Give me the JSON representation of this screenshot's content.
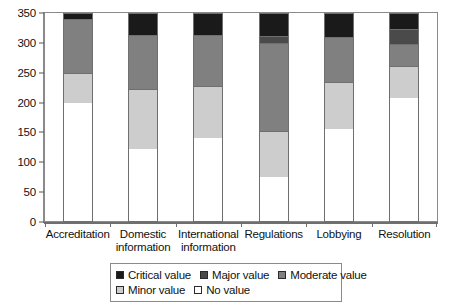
{
  "chart_data": {
    "type": "bar",
    "stacked": true,
    "title": "",
    "xlabel": "",
    "ylabel": "",
    "ylim": [
      0,
      350
    ],
    "ytick_step": 50,
    "yticks": [
      0,
      50,
      100,
      150,
      200,
      250,
      300,
      350
    ],
    "grid": false,
    "legend_position": "bottom",
    "categories": [
      "Accreditation",
      "Domestic information",
      "International information",
      "Regulations",
      "Lobbying",
      "Resolution"
    ],
    "series": [
      {
        "name": "No value",
        "color": "#ffffff",
        "values": [
          200,
          122,
          140,
          75,
          155,
          208
        ]
      },
      {
        "name": "Minor value",
        "color": "#cdcdcd",
        "values": [
          50,
          101,
          88,
          77,
          80,
          54
        ]
      },
      {
        "name": "Moderate value",
        "color": "#808080",
        "values": [
          90,
          90,
          85,
          148,
          75,
          36
        ]
      },
      {
        "name": "Major value",
        "color": "#4a4a4a",
        "values": [
          0,
          0,
          0,
          12,
          0,
          25
        ]
      },
      {
        "name": "Critical value",
        "color": "#1a1a1a",
        "values": [
          10,
          37,
          37,
          38,
          40,
          27
        ]
      }
    ],
    "totals": [
      350,
      350,
      350,
      350,
      350,
      350
    ]
  },
  "axes": {
    "y_tick_labels": [
      "350",
      "300",
      "250",
      "200",
      "150",
      "100",
      "50",
      "0"
    ],
    "x_tick_labels": [
      "Accreditation",
      "Domestic information",
      "International information",
      "Regulations",
      "Lobbying",
      "Resolution"
    ]
  },
  "legend": {
    "row1": [
      {
        "label": "Critical value",
        "color": "#1a1a1a"
      },
      {
        "label": "Major value",
        "color": "#4a4a4a"
      },
      {
        "label": "Moderate value",
        "color": "#808080"
      }
    ],
    "row2": [
      {
        "label": "Minor value",
        "color": "#cdcdcd"
      },
      {
        "label": "No value",
        "color": "#ffffff"
      }
    ]
  }
}
